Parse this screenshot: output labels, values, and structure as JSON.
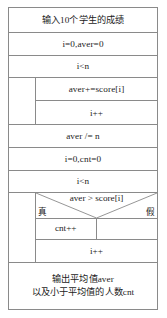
{
  "diagram": {
    "type": "nassi-shneiderman-flowchart",
    "border_color": "#8a8a8a",
    "text_color": "#1c1c1c",
    "background_color": "#ffffff",
    "blocks": {
      "input": "输入10个学生的成绩",
      "init1": "i=0,aver=0",
      "loop1_condition": "i<n",
      "loop1_body_1": "aver+=score[i]",
      "loop1_body_2": "i++",
      "average": "aver /= n",
      "init2": "i=0,cnt=0",
      "loop2_condition": "i<n",
      "selection_condition": "aver > score[i]",
      "selection_true_label": "真",
      "selection_false_label": "假",
      "selection_true_body": "cnt++",
      "selection_false_body": "",
      "loop2_body_2": "i++",
      "output_line1": "输出平均值aver",
      "output_line2": "以及小于平均值的人数cnt"
    }
  }
}
